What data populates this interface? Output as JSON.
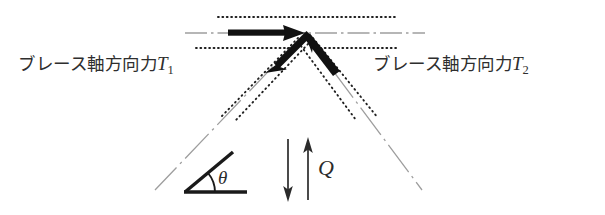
{
  "figure": {
    "type": "force-equilibrium-diagram",
    "title_left_label": "ブレース軸方向力T",
    "labels": {
      "brace_force_left": {
        "text": "ブレース軸方向力",
        "symbol": "T",
        "subscript": "1",
        "full": "ブレース軸方向力T1"
      },
      "brace_force_right": {
        "text": "ブレース軸方向力",
        "symbol": "T",
        "subscript": "2",
        "full": "ブレース軸方向力T2"
      },
      "angle": "θ",
      "shear_force": "Q"
    },
    "colors": {
      "ink": "#1a1a1a",
      "arrow": "#111111",
      "chain_line": "#9a9a9a",
      "dotted_line": "#1f1f1f",
      "text": "#2e2e2e",
      "background": "#ffffff"
    },
    "geometry": {
      "apex": {
        "x": 305,
        "y": 33
      },
      "horizontal_chain_line": {
        "x1": 185,
        "y1": 33,
        "x2": 425,
        "y2": 33
      },
      "upper_dotted_line": {
        "x1": 218,
        "y1": 17,
        "x2": 398,
        "y2": 17
      },
      "lower_dotted_line": {
        "x1": 196,
        "y1": 48,
        "x2": 398,
        "y2": 48
      },
      "left_brace_chain": {
        "x1": 305,
        "y1": 33,
        "x2": 155,
        "y2": 190
      },
      "right_brace_chain": {
        "x1": 305,
        "y1": 33,
        "x2": 422,
        "y2": 190
      },
      "arrow_t1_horizontal": {
        "x1": 228,
        "y1": 33,
        "x2": 305,
        "y2": 34
      },
      "arrow_t1_diagonal": {
        "x1": 305,
        "y1": 35,
        "x2": 266,
        "y2": 66
      },
      "arrow_t2_diagonal": {
        "x1": 338,
        "y1": 72,
        "x2": 304,
        "y2": 34
      },
      "q_arrow_down": {
        "x1": 288,
        "y1": 140,
        "x2": 288,
        "y2": 200
      },
      "q_arrow_up": {
        "x1": 308,
        "y1": 200,
        "x2": 308,
        "y2": 140
      },
      "theta_baseline": {
        "x1": 186,
        "y1": 192,
        "x2": 246,
        "y2": 192
      },
      "theta_hypotenuse": {
        "x1": 186,
        "y1": 192,
        "x2": 232,
        "y2": 153
      }
    },
    "icon_names": {
      "t1_horizontal_arrow": "arrow-right-icon",
      "t1_diagonal_arrow": "arrow-down-left-icon",
      "t2_diagonal_arrow": "arrow-up-left-icon",
      "q_down_arrow": "arrow-down-icon",
      "q_up_arrow": "arrow-up-icon",
      "angle_marker": "angle-arc-icon"
    }
  }
}
